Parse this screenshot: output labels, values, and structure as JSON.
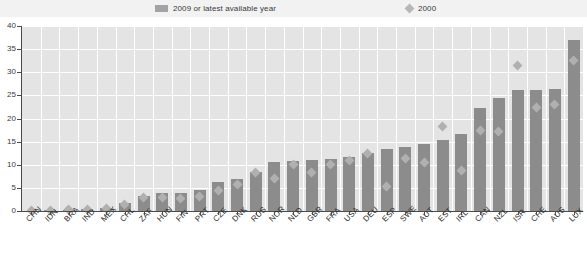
{
  "legend": {
    "position": "top",
    "entries": [
      {
        "label": "2009 or latest available year",
        "marker": "bar-swatch",
        "color": "#8c8c8c"
      },
      {
        "label": "2000",
        "marker": "diamond",
        "color": "#b0b0b0"
      }
    ]
  },
  "axis": {
    "y_ticks": [
      "0",
      "5",
      "10",
      "15",
      "20",
      "25",
      "30",
      "35",
      "40"
    ]
  },
  "chart_data": {
    "type": "bar",
    "title": "",
    "subtitle": "",
    "xlabel": "",
    "ylabel": "",
    "ylim": [
      0,
      40
    ],
    "ytick_step": 5,
    "grid": true,
    "legend_position": "top",
    "categories": [
      "CHN",
      "IDN",
      "BRA",
      "IND",
      "MEX",
      "CHL",
      "ZAF",
      "HUN",
      "FIN",
      "PRT",
      "CZE",
      "DNK",
      "RUS",
      "NOR",
      "NLD",
      "GBR",
      "FRA",
      "USA",
      "DEU",
      "ESP",
      "SWE",
      "AUT",
      "EST",
      "IRL",
      "CAN",
      "NZL",
      "ISR",
      "CHE",
      "AUS",
      "LUX"
    ],
    "series": [
      {
        "name": "2009 or latest available year",
        "type": "bar",
        "color": "#8c8c8c",
        "values": [
          0.1,
          0.2,
          0.3,
          0.4,
          0.6,
          1.8,
          3.3,
          3.8,
          3.9,
          4.5,
          6.3,
          7.0,
          8.5,
          10.6,
          10.9,
          11.1,
          11.3,
          11.7,
          12.6,
          13.4,
          13.9,
          14.5,
          15.4,
          16.7,
          22.2,
          24.5,
          26.1,
          26.2,
          26.4,
          37.0
        ]
      },
      {
        "name": "2000",
        "type": "scatter",
        "marker": "diamond",
        "color": "#b0b0b0",
        "values": [
          0.1,
          0.2,
          0.3,
          0.3,
          0.5,
          1.3,
          2.9,
          3.0,
          2.6,
          3.1,
          4.5,
          5.8,
          8.3,
          7.0,
          10.1,
          8.3,
          10.1,
          11.0,
          12.5,
          5.3,
          11.3,
          10.4,
          18.2,
          8.7,
          17.4,
          17.2,
          31.5,
          22.4,
          23.0,
          32.6
        ]
      }
    ]
  }
}
